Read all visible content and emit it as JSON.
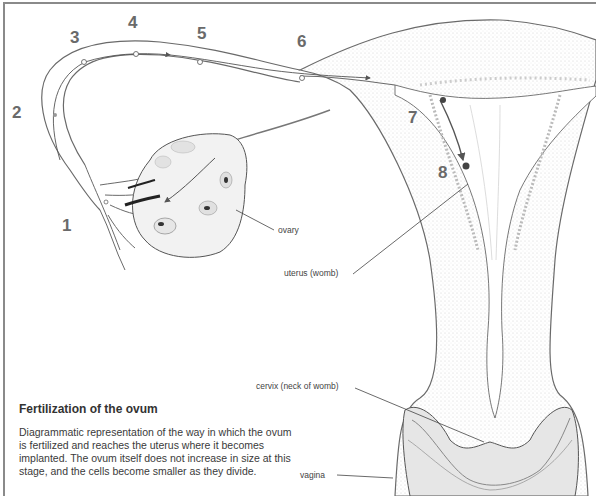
{
  "figure": {
    "title": "Fertilization of the ovum",
    "description": "Diagrammatic representation of the way in which the ovum is fertilized and reaches the uterus where it becomes implanted. The ovum itself does not increase in size at this stage, and the cells become smaller as they divide."
  },
  "stage_markers": [
    {
      "label": "1",
      "x": 62,
      "y": 216
    },
    {
      "label": "2",
      "x": 12,
      "y": 103
    },
    {
      "label": "3",
      "x": 70,
      "y": 28
    },
    {
      "label": "4",
      "x": 128,
      "y": 13
    },
    {
      "label": "5",
      "x": 197,
      "y": 24
    },
    {
      "label": "6",
      "x": 297,
      "y": 32
    },
    {
      "label": "7",
      "x": 408,
      "y": 108
    },
    {
      "label": "8",
      "x": 438,
      "y": 163
    }
  ],
  "anatomy_labels": {
    "ovary": "ovary",
    "uterus": "uterus (womb)",
    "cervix": "cervix (neck of womb)",
    "vagina": "vagina"
  },
  "colors": {
    "line": "#5a5a5a",
    "frame": "#8a8a8a",
    "stipple": "#d8d8d8",
    "text": "#3a3a3a"
  }
}
